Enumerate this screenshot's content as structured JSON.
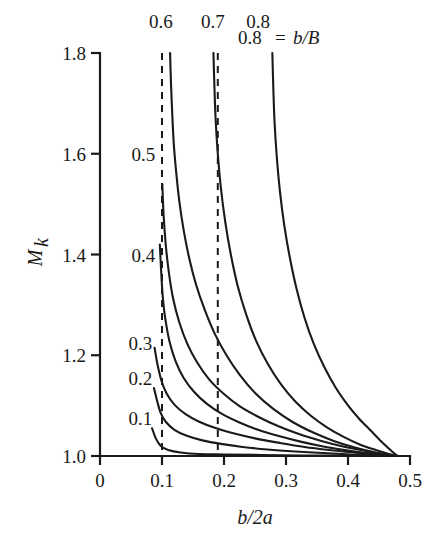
{
  "chart_data": {
    "type": "line",
    "title": "",
    "xlabel": "b/2a",
    "ylabel": "M_k",
    "ylabel_base": "M",
    "ylabel_sub": "k",
    "xlim": [
      0,
      0.5
    ],
    "ylim": [
      1.0,
      1.8
    ],
    "grid": false,
    "legend_position": "inline-curve-labels",
    "legend_note": "0.8 = b/B",
    "legend_note_value": "0.8",
    "legend_note_equals": "=",
    "legend_note_param": "b/B",
    "xticks": [
      0,
      0.1,
      0.2,
      0.3,
      0.4,
      0.5
    ],
    "xtick_labels": [
      "0",
      "0.1",
      "0.2",
      "0.3",
      "0.4",
      "0.5"
    ],
    "yticks": [
      1.0,
      1.2,
      1.4,
      1.6,
      1.8
    ],
    "ytick_labels": [
      "1.0",
      "1.2",
      "1.4",
      "1.6",
      "1.8"
    ],
    "annotations": [
      {
        "name": "asymptote-1",
        "type": "vertical-dashed",
        "x": 0.1
      },
      {
        "name": "asymptote-2",
        "type": "vertical-dashed",
        "x": 0.19
      }
    ],
    "series": [
      {
        "name": "0.1",
        "label": "0.1",
        "label_x": 0.065,
        "label_y": 1.075,
        "points": [
          [
            0.084,
            1.055
          ],
          [
            0.09,
            1.035
          ],
          [
            0.098,
            1.02
          ],
          [
            0.11,
            1.012
          ],
          [
            0.13,
            1.007
          ],
          [
            0.16,
            1.004
          ],
          [
            0.2,
            1.003
          ],
          [
            0.26,
            1.002
          ],
          [
            0.33,
            1.001
          ],
          [
            0.41,
            1.001
          ],
          [
            0.47,
            1.0
          ],
          [
            0.48,
            1.0
          ]
        ]
      },
      {
        "name": "0.2",
        "label": "0.2",
        "label_x": 0.065,
        "label_y": 1.155,
        "points": [
          [
            0.087,
            1.135
          ],
          [
            0.092,
            1.11
          ],
          [
            0.098,
            1.085
          ],
          [
            0.106,
            1.068
          ],
          [
            0.12,
            1.052
          ],
          [
            0.14,
            1.04
          ],
          [
            0.165,
            1.031
          ],
          [
            0.195,
            1.024
          ],
          [
            0.23,
            1.018
          ],
          [
            0.27,
            1.013
          ],
          [
            0.315,
            1.009
          ],
          [
            0.36,
            1.006
          ],
          [
            0.405,
            1.003
          ],
          [
            0.445,
            1.001
          ],
          [
            0.48,
            1.0
          ]
        ]
      },
      {
        "name": "0.3",
        "label": "0.3",
        "label_x": 0.065,
        "label_y": 1.225,
        "points": [
          [
            0.088,
            1.215
          ],
          [
            0.093,
            1.18
          ],
          [
            0.099,
            1.15
          ],
          [
            0.107,
            1.125
          ],
          [
            0.12,
            1.102
          ],
          [
            0.138,
            1.083
          ],
          [
            0.16,
            1.068
          ],
          [
            0.185,
            1.056
          ],
          [
            0.215,
            1.045
          ],
          [
            0.25,
            1.035
          ],
          [
            0.29,
            1.026
          ],
          [
            0.33,
            1.018
          ],
          [
            0.37,
            1.012
          ],
          [
            0.41,
            1.007
          ],
          [
            0.445,
            1.003
          ],
          [
            0.48,
            1.0
          ]
        ]
      },
      {
        "name": "0.4",
        "label": "0.4",
        "label_x": 0.07,
        "label_y": 1.4,
        "points": [
          [
            0.0965,
            1.42
          ],
          [
            0.0985,
            1.37
          ],
          [
            0.101,
            1.32
          ],
          [
            0.105,
            1.275
          ],
          [
            0.112,
            1.228
          ],
          [
            0.122,
            1.188
          ],
          [
            0.135,
            1.155
          ],
          [
            0.152,
            1.127
          ],
          [
            0.172,
            1.104
          ],
          [
            0.196,
            1.084
          ],
          [
            0.224,
            1.067
          ],
          [
            0.255,
            1.052
          ],
          [
            0.29,
            1.039
          ],
          [
            0.325,
            1.028
          ],
          [
            0.36,
            1.019
          ],
          [
            0.395,
            1.012
          ],
          [
            0.43,
            1.006
          ],
          [
            0.46,
            1.002
          ],
          [
            0.48,
            1.0
          ]
        ]
      },
      {
        "name": "0.5",
        "label": "0.5",
        "label_x": 0.07,
        "label_y": 1.6,
        "points": [
          [
            0.1005,
            1.54
          ],
          [
            0.1025,
            1.48
          ],
          [
            0.106,
            1.42
          ],
          [
            0.111,
            1.365
          ],
          [
            0.118,
            1.312
          ],
          [
            0.128,
            1.265
          ],
          [
            0.141,
            1.222
          ],
          [
            0.157,
            1.185
          ],
          [
            0.176,
            1.152
          ],
          [
            0.199,
            1.124
          ],
          [
            0.225,
            1.099
          ],
          [
            0.255,
            1.078
          ],
          [
            0.288,
            1.059
          ],
          [
            0.322,
            1.043
          ],
          [
            0.357,
            1.03
          ],
          [
            0.392,
            1.019
          ],
          [
            0.428,
            1.01
          ],
          [
            0.458,
            1.003
          ],
          [
            0.48,
            1.0
          ]
        ]
      },
      {
        "name": "0.6",
        "label": "0.6",
        "label_x": 0.098,
        "label_y": 1.88,
        "points": [
          [
            0.113,
            1.8
          ],
          [
            0.1145,
            1.74
          ],
          [
            0.1165,
            1.68
          ],
          [
            0.119,
            1.62
          ],
          [
            0.123,
            1.562
          ],
          [
            0.128,
            1.505
          ],
          [
            0.135,
            1.448
          ],
          [
            0.144,
            1.392
          ],
          [
            0.155,
            1.34
          ],
          [
            0.169,
            1.29
          ],
          [
            0.185,
            1.243
          ],
          [
            0.204,
            1.2
          ],
          [
            0.226,
            1.16
          ],
          [
            0.251,
            1.124
          ],
          [
            0.279,
            1.094
          ],
          [
            0.31,
            1.068
          ],
          [
            0.343,
            1.047
          ],
          [
            0.377,
            1.03
          ],
          [
            0.411,
            1.017
          ],
          [
            0.445,
            1.007
          ],
          [
            0.47,
            1.002
          ],
          [
            0.48,
            1.0
          ]
        ]
      },
      {
        "name": "0.7",
        "label": "0.7",
        "label_x": 0.182,
        "label_y": 1.88,
        "points": [
          [
            0.183,
            1.8
          ],
          [
            0.1845,
            1.735
          ],
          [
            0.1865,
            1.668
          ],
          [
            0.19,
            1.6
          ],
          [
            0.195,
            1.532
          ],
          [
            0.202,
            1.465
          ],
          [
            0.211,
            1.4
          ],
          [
            0.222,
            1.338
          ],
          [
            0.236,
            1.28
          ],
          [
            0.252,
            1.228
          ],
          [
            0.271,
            1.182
          ],
          [
            0.292,
            1.142
          ],
          [
            0.315,
            1.108
          ],
          [
            0.34,
            1.08
          ],
          [
            0.366,
            1.057
          ],
          [
            0.393,
            1.038
          ],
          [
            0.419,
            1.023
          ],
          [
            0.445,
            1.012
          ],
          [
            0.466,
            1.004
          ],
          [
            0.48,
            1.0
          ]
        ]
      },
      {
        "name": "0.8",
        "label": "0.8",
        "label_x": 0.255,
        "label_y": 1.88,
        "points": [
          [
            0.278,
            1.8
          ],
          [
            0.2795,
            1.732
          ],
          [
            0.2815,
            1.664
          ],
          [
            0.285,
            1.596
          ],
          [
            0.29,
            1.528
          ],
          [
            0.297,
            1.46
          ],
          [
            0.306,
            1.395
          ],
          [
            0.317,
            1.332
          ],
          [
            0.33,
            1.274
          ],
          [
            0.345,
            1.222
          ],
          [
            0.362,
            1.176
          ],
          [
            0.38,
            1.136
          ],
          [
            0.399,
            1.102
          ],
          [
            0.418,
            1.074
          ],
          [
            0.437,
            1.05
          ],
          [
            0.452,
            1.031
          ],
          [
            0.464,
            1.017
          ],
          [
            0.473,
            1.007
          ],
          [
            0.48,
            1.0
          ]
        ]
      }
    ]
  }
}
